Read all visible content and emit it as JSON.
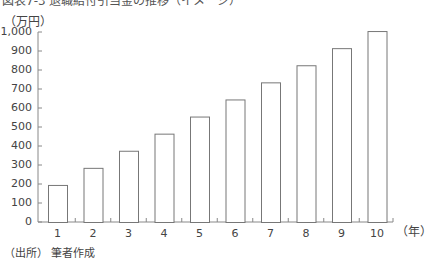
{
  "header": {
    "title": "図表7-3 退職給付引当金の推移（イメージ）",
    "unit_label": "（万円）"
  },
  "footer": {
    "source": "（出所） 筆者作成"
  },
  "chart_data": {
    "type": "bar",
    "title": "",
    "xlabel": "（年）",
    "ylabel": "（万円）",
    "categories": [
      "1",
      "2",
      "3",
      "4",
      "5",
      "6",
      "7",
      "8",
      "9",
      "10"
    ],
    "values": [
      195,
      285,
      375,
      465,
      555,
      645,
      735,
      825,
      915,
      1005
    ],
    "ylim": [
      0,
      1000
    ],
    "yticks": [
      "0",
      "100",
      "200",
      "300",
      "400",
      "500",
      "600",
      "700",
      "800",
      "900",
      "1,000"
    ],
    "grid": false,
    "legend": null,
    "bar_fill": "#ffffff",
    "bar_stroke": "#777777"
  }
}
